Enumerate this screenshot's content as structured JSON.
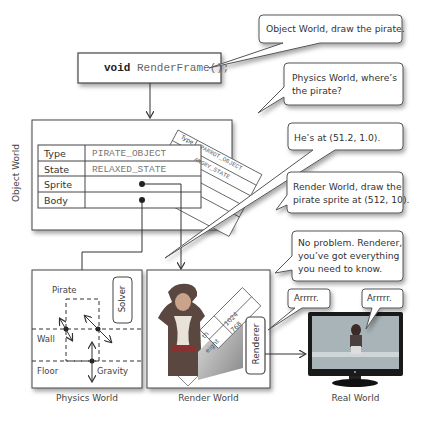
{
  "code_box": {
    "keyword": "void",
    "call": "RenderFrame();"
  },
  "bubbles": [
    {
      "id": "b1",
      "text": "Object World, draw the pirate."
    },
    {
      "id": "b2",
      "line1": "Physics World, where’s",
      "line2": "the pirate?"
    },
    {
      "id": "b3",
      "text": "He’s at (51.2, 1.0)."
    },
    {
      "id": "b4",
      "line1": "Render World, draw the",
      "line2": "pirate sprite at (512, 10)."
    },
    {
      "id": "b5",
      "line1": "No problem. Renderer,",
      "line2": "you’ve got everything",
      "line3": "you need to know."
    },
    {
      "id": "b6",
      "text": "Arrrrr."
    },
    {
      "id": "b7",
      "text": "Arrrrr."
    }
  ],
  "object_world": {
    "label": "Object World",
    "rows": [
      {
        "label": "Type",
        "value": "PIRATE_OBJECT"
      },
      {
        "label": "State",
        "value": "RELAXED_STATE"
      },
      {
        "label": "Sprite",
        "value": ""
      },
      {
        "label": "Body",
        "value": ""
      }
    ],
    "back_card": {
      "type_label": "Type",
      "type_value": "PARROT_OBJECT",
      "state_value": "ANGRY_STATE"
    }
  },
  "physics_world": {
    "caption": "Physics World",
    "labels": {
      "pirate": "Pirate",
      "wall": "Wall",
      "floor": "Floor",
      "gravity": "Gravity",
      "solver": "Solver"
    }
  },
  "render_world": {
    "caption": "Render World",
    "screen_card": {
      "row1_label": "th",
      "row1_value": "1024",
      "row2_label": "eight",
      "row2_value": "768"
    },
    "renderer": "Renderer"
  },
  "real_world": {
    "caption": "Real World"
  }
}
